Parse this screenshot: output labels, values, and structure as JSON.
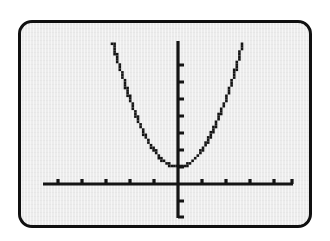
{
  "device": {
    "screen_label": "graphing-calculator-screen",
    "bezel_color": "#101010",
    "screen_background_color": "#ececec",
    "ink_color": "#141414",
    "page_background_color": "#ffffff"
  },
  "chart_data": {
    "type": "line",
    "title": "",
    "subtitle": "",
    "xlabel": "",
    "ylabel": "",
    "grid": false,
    "legend": null,
    "annotations": [],
    "curve_style": "dotted-pixel-plot",
    "function": "y = x^2 + 1",
    "vertex": [
      0,
      1
    ],
    "axis": {
      "x_axis_visible": true,
      "y_axis_visible": true,
      "x_axis_pixel_y": 178,
      "y_axis_pixel_x": 175,
      "x_axis_pixel_start": 40,
      "x_axis_pixel_end": 290,
      "y_axis_pixel_top": 35,
      "y_axis_pixel_bottom": 212,
      "x_tick_count_left": 5,
      "x_tick_count_right": 5,
      "y_tick_count_above": 7,
      "y_tick_count_below": 2,
      "x_tick_spacing_px": 24,
      "y_tick_spacing_px": 17
    },
    "xlim": [
      -5.2,
      4.8
    ],
    "ylim": [
      -2,
      8.4
    ],
    "x": [
      -2.7,
      -2.5,
      -2.3,
      -2.1,
      -1.9,
      -1.7,
      -1.5,
      -1.3,
      -1.1,
      -0.9,
      -0.7,
      -0.5,
      -0.3,
      -0.1,
      0.1,
      0.3,
      0.5,
      0.7,
      0.9,
      1.1,
      1.3,
      1.5,
      1.7,
      1.9,
      2.1,
      2.3,
      2.5,
      2.7
    ],
    "values": [
      8.29,
      7.25,
      6.29,
      5.41,
      4.61,
      3.89,
      3.25,
      2.69,
      2.21,
      1.81,
      1.49,
      1.25,
      1.09,
      1.01,
      1.01,
      1.09,
      1.25,
      1.49,
      1.81,
      2.21,
      2.69,
      3.25,
      3.89,
      4.61,
      5.41,
      6.29,
      7.25,
      8.29
    ],
    "series": [
      {
        "name": "y = x^2 + 1",
        "x": [
          -2.7,
          -2.5,
          -2.3,
          -2.1,
          -1.9,
          -1.7,
          -1.5,
          -1.3,
          -1.1,
          -0.9,
          -0.7,
          -0.5,
          -0.3,
          -0.1,
          0.1,
          0.3,
          0.5,
          0.7,
          0.9,
          1.1,
          1.3,
          1.5,
          1.7,
          1.9,
          2.1,
          2.3,
          2.5,
          2.7
        ],
        "values": [
          8.29,
          7.25,
          6.29,
          5.41,
          4.61,
          3.89,
          3.25,
          2.69,
          2.21,
          1.81,
          1.49,
          1.25,
          1.09,
          1.01,
          1.01,
          1.09,
          1.25,
          1.49,
          1.81,
          2.21,
          2.69,
          3.25,
          3.89,
          4.61,
          5.41,
          6.29,
          7.25,
          8.29
        ]
      }
    ]
  }
}
